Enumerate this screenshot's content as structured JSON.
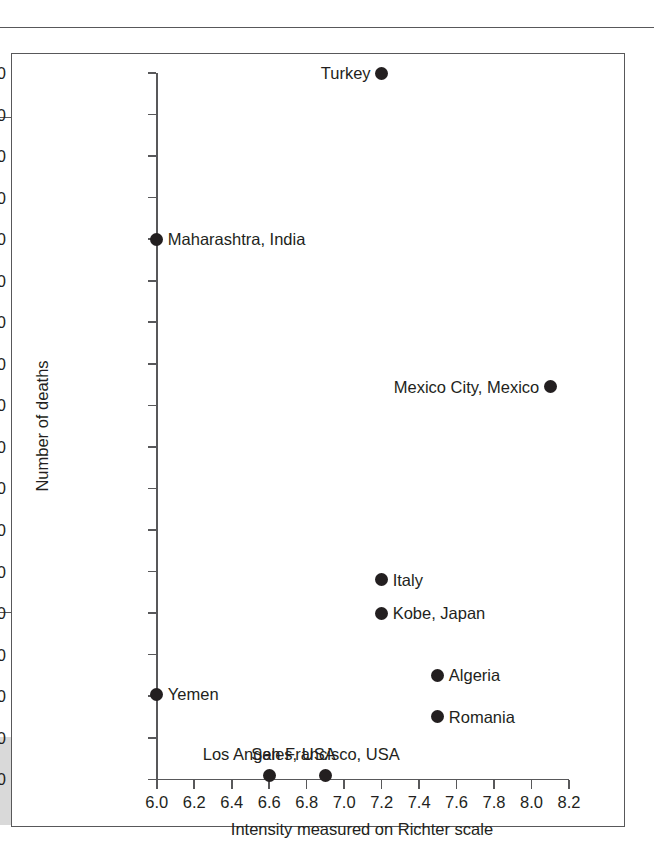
{
  "page": {
    "background_color": "#ffffff",
    "ink_color": "#231f20",
    "rule_color": "#58585a",
    "gray_strip_color": "#d9d9d9"
  },
  "chart_data": {
    "type": "scatter",
    "title": "",
    "xlabel": "Intensity measured on Richter scale",
    "ylabel": "Number of deaths",
    "xlim": [
      6.0,
      8.2
    ],
    "ylim": [
      0,
      17000
    ],
    "grid": false,
    "legend": "none",
    "xticks": [
      6.0,
      6.2,
      6.4,
      6.6,
      6.8,
      7.0,
      7.2,
      7.4,
      7.6,
      7.8,
      8.0,
      8.2
    ],
    "xtick_labels": [
      "6.0",
      "6.2",
      "6.4",
      "6.6",
      "6.8",
      "7.0",
      "7.2",
      "7.4",
      "7.6",
      "7.8",
      "8.0",
      "8.2"
    ],
    "yticks": [
      0,
      1000,
      2000,
      3000,
      4000,
      5000,
      6000,
      7000,
      8000,
      9000,
      10000,
      11000,
      12000,
      13000,
      14000,
      15000,
      16000,
      17000
    ],
    "ytick_labels": [
      "0",
      "1000",
      "2000",
      "3000",
      "4000",
      "5000",
      "6000",
      "7000",
      "8000",
      "9000",
      "10 000",
      "11 000",
      "12 000",
      "13 000",
      "14 000",
      "15 000",
      "16 000",
      "17 000"
    ],
    "marker": "filled-circle",
    "marker_color": "#231f20",
    "points": [
      {
        "label": "Turkey",
        "x": 7.2,
        "y": 17000,
        "label_position": "left"
      },
      {
        "label": "Maharashtra, India",
        "x": 6.0,
        "y": 13000,
        "label_position": "right"
      },
      {
        "label": "Mexico City, Mexico",
        "x": 8.1,
        "y": 9450,
        "label_position": "left"
      },
      {
        "label": "Italy",
        "x": 7.2,
        "y": 4800,
        "label_position": "right"
      },
      {
        "label": "Kobe, Japan",
        "x": 7.2,
        "y": 4000,
        "label_position": "right"
      },
      {
        "label": "Algeria",
        "x": 7.5,
        "y": 2500,
        "label_position": "right"
      },
      {
        "label": "Yemen",
        "x": 6.0,
        "y": 2050,
        "label_position": "right"
      },
      {
        "label": "Romania",
        "x": 7.5,
        "y": 1500,
        "label_position": "right"
      },
      {
        "label": "Los Angeles, USA",
        "x": 6.6,
        "y": 100,
        "label_position": "above"
      },
      {
        "label": "San Francisco, USA",
        "x": 6.9,
        "y": 100,
        "label_position": "above"
      }
    ]
  }
}
